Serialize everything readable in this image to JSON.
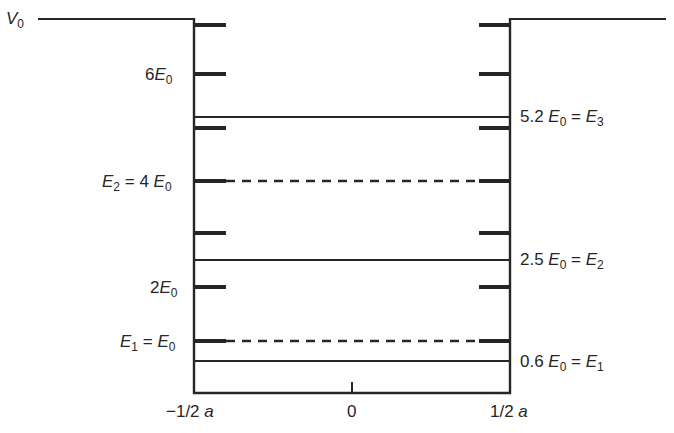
{
  "diagram": {
    "type": "finite square well energy levels",
    "potential_label": {
      "symbol": "V",
      "sub": "0"
    },
    "x_axis": {
      "left_label": "−1/2 a",
      "center_label": "0",
      "right_label": "1/2 a"
    },
    "left_labels": [
      {
        "id": "six-e0",
        "prefix": "6",
        "symbol": "E",
        "sub": "0",
        "text": "6E0"
      },
      {
        "id": "e2-infinite",
        "symbol": "E",
        "sub": "2",
        "eq": " = 4 ",
        "symbol2": "E",
        "sub2": "0",
        "text": "E2 = 4 E0"
      },
      {
        "id": "two-e0",
        "prefix": "2",
        "symbol": "E",
        "sub": "0",
        "text": "2E0"
      },
      {
        "id": "e1-infinite",
        "symbol": "E",
        "sub": "1",
        "eq": " = ",
        "symbol2": "E",
        "sub2": "0",
        "text": "E1 = E0"
      }
    ],
    "right_labels": [
      {
        "id": "e3-finite",
        "value": "5.2 ",
        "symbol": "E",
        "sub": "0",
        "eq": " = ",
        "symbol2": "E",
        "sub2": "3",
        "text": "5.2 E0 = E3"
      },
      {
        "id": "e2-finite",
        "value": "2.5 ",
        "symbol": "E",
        "sub": "0",
        "eq": " = ",
        "symbol2": "E",
        "sub2": "2",
        "text": "2.5 E0 = E2"
      },
      {
        "id": "e1-finite",
        "value": "0.6 ",
        "symbol": "E",
        "sub": "0",
        "eq": " = ",
        "symbol2": "E",
        "sub2": "1",
        "text": "0.6 E0 = E1"
      }
    ],
    "levels_finite_solid": [
      5.2,
      2.5,
      0.6
    ],
    "levels_infinite_dashed": [
      4,
      1
    ],
    "tick_marks_E0": [
      1,
      2,
      3,
      4,
      5,
      6,
      7
    ],
    "colors": {
      "line": "#262626",
      "background": "#ffffff"
    }
  }
}
